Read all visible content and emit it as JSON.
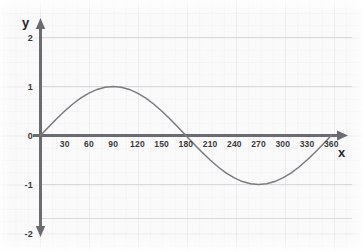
{
  "figure": {
    "background_color": "#fafafa",
    "axis_color": "#6b6b72",
    "curve_color": "#7a7a80",
    "label_color": "#2e2e32"
  },
  "axes": {
    "y_axis_name": "y",
    "x_axis_name": "x"
  },
  "chart_data": {
    "type": "line",
    "title": "",
    "subtitle": "",
    "xlabel": "x",
    "ylabel": "y",
    "function": "y = sin(x)",
    "grid": true,
    "grid_style": "faint square grid",
    "legend": null,
    "legend_position": "none",
    "xlim": [
      0,
      372
    ],
    "ylim": [
      -2.3,
      2.3
    ],
    "x_tick_labels": [
      "30",
      "60",
      "90",
      "120",
      "150",
      "180",
      "210",
      "240",
      "270",
      "300",
      "330",
      "360"
    ],
    "x_ticks": [
      30,
      60,
      90,
      120,
      150,
      180,
      210,
      240,
      270,
      300,
      330,
      360
    ],
    "y_tick_labels": [
      "2",
      "1",
      "0",
      "-1",
      "-2"
    ],
    "y_ticks": [
      2,
      1,
      0,
      -1,
      -2
    ],
    "series": [
      {
        "name": "sin(x)",
        "color": "#7a7a80",
        "x": [
          0,
          10,
          20,
          30,
          40,
          50,
          60,
          70,
          80,
          90,
          100,
          110,
          120,
          130,
          140,
          150,
          160,
          170,
          180,
          190,
          200,
          210,
          220,
          230,
          240,
          250,
          260,
          270,
          280,
          290,
          300,
          310,
          320,
          330,
          340,
          350,
          360
        ],
        "values": [
          0,
          0.174,
          0.342,
          0.5,
          0.643,
          0.766,
          0.866,
          0.94,
          0.985,
          1,
          0.985,
          0.94,
          0.866,
          0.766,
          0.643,
          0.5,
          0.342,
          0.174,
          0,
          -0.174,
          -0.342,
          -0.5,
          -0.643,
          -0.766,
          -0.866,
          -0.94,
          -0.985,
          -1,
          -0.985,
          -0.94,
          -0.866,
          -0.766,
          -0.643,
          -0.5,
          -0.342,
          -0.174,
          0
        ]
      }
    ],
    "annotations": [
      {
        "label": "maximum",
        "x": 90,
        "y": 1
      },
      {
        "label": "minimum",
        "x": 270,
        "y": -1
      },
      {
        "label": "zero-crossing",
        "x": 0,
        "y": 0
      },
      {
        "label": "zero-crossing",
        "x": 180,
        "y": 0
      },
      {
        "label": "zero-crossing",
        "x": 360,
        "y": 0
      }
    ]
  }
}
